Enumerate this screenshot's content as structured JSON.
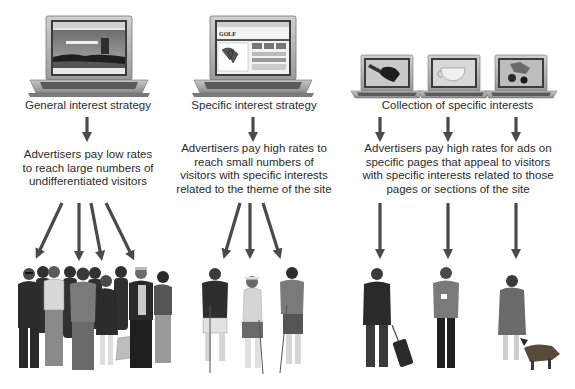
{
  "columns": [
    {
      "id": "general",
      "label": "General interest strategy",
      "description_lines": [
        "Advertisers pay low rates",
        "to reach large numbers of",
        "undifferentiated visitors"
      ],
      "laptops": [
        {
          "screen": "landscape-castle-photo"
        }
      ],
      "audience": "crowd-of-undifferentiated-visitors",
      "fan_arrow_count": 4
    },
    {
      "id": "specific",
      "label": "Specific interest strategy",
      "description_lines": [
        "Advertisers pay high rates to",
        "reach small numbers of",
        "visitors with specific interests",
        "related to the theme of the site"
      ],
      "laptops": [
        {
          "screen": "golf-website",
          "site_logo": "GOLF"
        }
      ],
      "audience": "three-golfers",
      "fan_arrow_count": 3
    },
    {
      "id": "collection",
      "label": "Collection of specific interests",
      "description_lines": [
        "Advertisers pay high rates for ads on",
        "specific pages that appeal to visitors",
        "with specific interests related to those",
        "pages or sections of the site"
      ],
      "laptops": [
        {
          "screen": "rolling-suitcase"
        },
        {
          "screen": "coffee-cup"
        },
        {
          "screen": "dog-and-cat"
        }
      ],
      "audience": "three-individual-visitors",
      "audience_members": [
        "business-traveler-with-suitcase",
        "man-holding-coffee-cup",
        "woman-with-dog"
      ],
      "fan_arrow_count": 3
    }
  ],
  "colors": {
    "arrow": "#4a4a4a",
    "text": "#2b2b2b",
    "laptop_body": "#a9a9a9",
    "laptop_bezel": "#5a5a5a",
    "background": "#ffffff"
  }
}
